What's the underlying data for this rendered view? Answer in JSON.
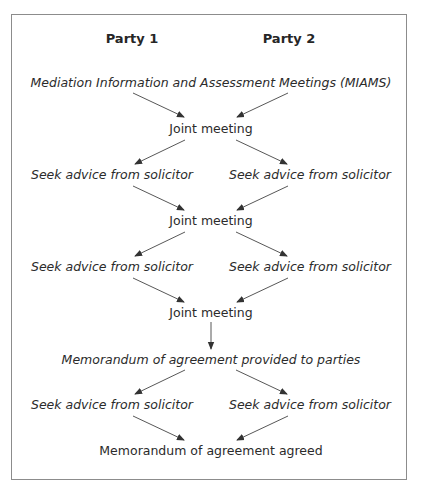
{
  "diagram": {
    "type": "flowchart",
    "headers": {
      "party1": "Party 1",
      "party2": "Party 2"
    },
    "nodes": {
      "miams": "Mediation Information and Assessment Meetings (MIAMS)",
      "joint1": "Joint meeting",
      "advice1_left": "Seek advice from solicitor",
      "advice1_right": "Seek advice from solicitor",
      "joint2": "Joint meeting",
      "advice2_left": "Seek advice from solicitor",
      "advice2_right": "Seek advice from solicitor",
      "joint3": "Joint meeting",
      "memo_provided": "Memorandum of agreement provided to parties",
      "advice3_left": "Seek advice from solicitor",
      "advice3_right": "Seek advice from solicitor",
      "memo_agreed": "Memorandum of agreement agreed"
    },
    "edges": [
      {
        "from": "miams",
        "to": "joint1"
      },
      {
        "from": "miams",
        "to": "joint1"
      },
      {
        "from": "joint1",
        "to": "advice1_left"
      },
      {
        "from": "joint1",
        "to": "advice1_right"
      },
      {
        "from": "advice1_left",
        "to": "joint2"
      },
      {
        "from": "advice1_right",
        "to": "joint2"
      },
      {
        "from": "joint2",
        "to": "advice2_left"
      },
      {
        "from": "joint2",
        "to": "advice2_right"
      },
      {
        "from": "advice2_left",
        "to": "joint3"
      },
      {
        "from": "advice2_right",
        "to": "joint3"
      },
      {
        "from": "joint3",
        "to": "memo_provided"
      },
      {
        "from": "memo_provided",
        "to": "advice3_left"
      },
      {
        "from": "memo_provided",
        "to": "advice3_right"
      },
      {
        "from": "advice3_left",
        "to": "memo_agreed"
      },
      {
        "from": "advice3_right",
        "to": "memo_agreed"
      }
    ],
    "colors": {
      "border": "#8c8c8c",
      "text": "#2b2b2b",
      "arrow": "#333333"
    }
  }
}
